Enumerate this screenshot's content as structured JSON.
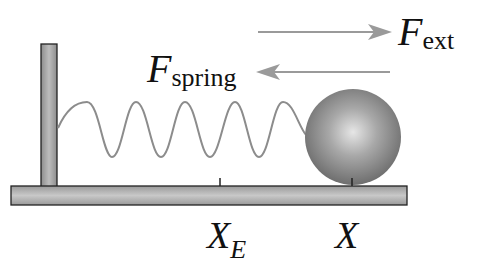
{
  "diagram": {
    "forces": {
      "external": {
        "symbol": "F",
        "subscript": "ext",
        "direction": "right"
      },
      "spring": {
        "symbol": "F",
        "subscript": "spring",
        "direction": "left"
      }
    },
    "axis_labels": {
      "equilibrium": {
        "symbol": "X",
        "subscript": "E"
      },
      "position": {
        "symbol": "X"
      }
    },
    "colors": {
      "arrow": "#9a9a9a",
      "spring": "#8c8c8c",
      "surface": "#a8a8a8",
      "ball": "#8a8a8a",
      "outline": "#222222"
    }
  }
}
